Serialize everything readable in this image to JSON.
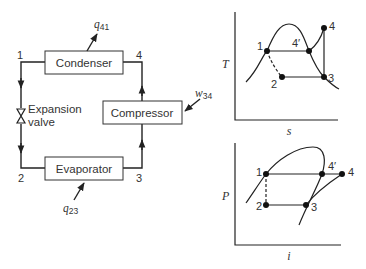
{
  "cycle": {
    "components": {
      "condenser": "Condenser",
      "compressor": "Compressor",
      "evaporator": "Evaporator",
      "expansion_valve_line1": "Expansion",
      "expansion_valve_line2": "valve"
    },
    "state_labels": {
      "s1": "1",
      "s2": "2",
      "s3": "3",
      "s4": "4"
    },
    "energy_labels": {
      "q41": {
        "sym": "q",
        "sub": "41"
      },
      "w34": {
        "sym": "w",
        "sub": "34"
      },
      "q23": {
        "sym": "q",
        "sub": "23"
      }
    }
  },
  "ts_diagram": {
    "ylabel": "T",
    "xlabel": "s",
    "points": {
      "p1": "1",
      "p2": "2",
      "p3": "3",
      "p4": "4",
      "p4prime": "4′"
    }
  },
  "pi_diagram": {
    "ylabel": "P",
    "xlabel": "i",
    "points": {
      "p1": "1",
      "p2": "2",
      "p3": "3",
      "p4": "4",
      "p4prime": "4′"
    }
  }
}
